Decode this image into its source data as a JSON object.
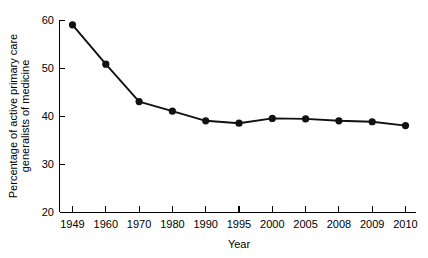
{
  "chart_data": {
    "type": "line",
    "title": "",
    "subtitle": "",
    "xlabel": "Year",
    "ylabel": "Percentage of active primary care generalists of medicine",
    "ylabel_lines": [
      "Percentage of active primary care",
      "generalists of medicine"
    ],
    "categories": [
      "1949",
      "1960",
      "1970",
      "1980",
      "1990",
      "1995",
      "2000",
      "2005",
      "2008",
      "2009",
      "2010"
    ],
    "values": [
      59.0,
      50.8,
      43.0,
      41.0,
      39.0,
      38.5,
      39.5,
      39.4,
      39.0,
      38.8,
      38.0
    ],
    "series": [
      {
        "name": "Percentage of active primary care generalists of medicine",
        "values": [
          59.0,
          50.8,
          43.0,
          41.0,
          39.0,
          38.5,
          39.5,
          39.4,
          39.0,
          38.8,
          38.0
        ]
      }
    ],
    "yticks": [
      20,
      30,
      40,
      50,
      60
    ],
    "ytick_labels": [
      "20",
      "30",
      "40",
      "50",
      "60"
    ],
    "xtick_labels": [
      "1949",
      "1960",
      "1970",
      "1980",
      "1990",
      "1995",
      "2000",
      "2005",
      "2008",
      "2009",
      "2010"
    ],
    "ylim": [
      20,
      60
    ],
    "grid": false,
    "legend": false,
    "legend_position": "none",
    "marker": "filled-circle",
    "line_color": "#111111",
    "marker_color": "#111111",
    "axis_color": "#000000",
    "background_color": "#ffffff"
  }
}
